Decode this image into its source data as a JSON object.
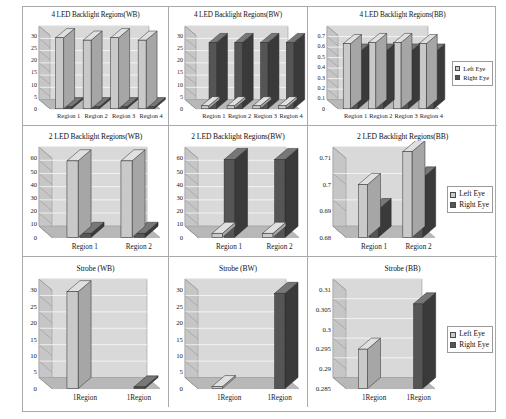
{
  "document": {
    "title": "Backlight Region Crosstalk Measurement Charts",
    "layout": "3x3 grid of 3D bar charts"
  },
  "legend": {
    "left_eye": "Left Eye",
    "right_eye": "Right Eye"
  },
  "colors": {
    "left_eye_fill": "#c9c9c9",
    "left_eye_side": "#a6a6a6",
    "left_eye_top": "#e0e0e0",
    "right_eye_fill": "#555555",
    "right_eye_side": "#3a3a3a",
    "right_eye_top": "#777777",
    "plot_back": "#d9d9d9",
    "plot_floor": "#b8b8b8",
    "plot_side": "#c6c6c6",
    "grid_line": "#ffffff",
    "border": "#a9a9a9"
  },
  "charts": [
    {
      "id": "chart-4led-wb",
      "chart_data": {
        "type": "bar",
        "title": "4 LED Backlight Regions(WB)",
        "xlabel": "",
        "ylabel": "",
        "categories": [
          "Region 1",
          "Region 2",
          "Region 3",
          "Region 4"
        ],
        "yticks": [
          0,
          5,
          10,
          15,
          20,
          25,
          30
        ],
        "ylim": [
          0,
          30
        ],
        "grid": true,
        "legend": false,
        "series": [
          {
            "name": "Left Eye",
            "values": [
              29.0,
              28.0,
              29.0,
              28.0
            ]
          },
          {
            "name": "Right Eye",
            "values": [
              0.8,
              0.8,
              0.8,
              0.8
            ]
          }
        ]
      }
    },
    {
      "id": "chart-4led-bw",
      "chart_data": {
        "type": "bar",
        "title": "4 LED Backlight Regions(BW)",
        "xlabel": "",
        "ylabel": "",
        "categories": [
          "Region 1",
          "Region 2",
          "Region 3",
          "Region 4"
        ],
        "yticks": [
          0,
          5,
          10,
          15,
          20,
          25,
          30
        ],
        "ylim": [
          0,
          30
        ],
        "grid": true,
        "legend": false,
        "series": [
          {
            "name": "Left Eye",
            "values": [
              1.2,
              1.2,
              1.2,
              1.2
            ]
          },
          {
            "name": "Right Eye",
            "values": [
              27.0,
              27.0,
              27.0,
              27.0
            ]
          }
        ]
      }
    },
    {
      "id": "chart-4led-bb",
      "chart_data": {
        "type": "bar",
        "title": "4 LED Backlight Regions(BB)",
        "xlabel": "",
        "ylabel": "",
        "categories": [
          "Region 1",
          "Region 2",
          "Region 3",
          "Region 4"
        ],
        "yticks": [
          0,
          0.1,
          0.2,
          0.3,
          0.4,
          0.5,
          0.6,
          0.7
        ],
        "yticklabels": [
          "0",
          "0.1",
          "0.2",
          "0.3",
          "0.4",
          "0.5",
          "0.6",
          "0.7"
        ],
        "ylim": [
          0,
          0.7
        ],
        "grid": true,
        "legend": true,
        "legend_position": "right",
        "series": [
          {
            "name": "Left Eye",
            "values": [
              0.62,
              0.63,
              0.63,
              0.62
            ]
          },
          {
            "name": "Right Eye",
            "values": [
              0.53,
              0.53,
              0.53,
              0.53
            ]
          }
        ]
      }
    },
    {
      "id": "chart-2led-wb",
      "chart_data": {
        "type": "bar",
        "title": "2 LED Backlight Regions(WB)",
        "xlabel": "",
        "ylabel": "",
        "categories": [
          "Region 1",
          "Region 2"
        ],
        "yticks": [
          0,
          10,
          20,
          30,
          40,
          50,
          60
        ],
        "ylim": [
          0,
          60
        ],
        "grid": true,
        "legend": false,
        "series": [
          {
            "name": "Left Eye",
            "values": [
              58.0,
              58.0
            ]
          },
          {
            "name": "Right Eye",
            "values": [
              3.0,
              3.0
            ]
          }
        ]
      }
    },
    {
      "id": "chart-2led-bw",
      "chart_data": {
        "type": "bar",
        "title": "2 LED Backlight Regions(BW)",
        "xlabel": "",
        "ylabel": "",
        "categories": [
          "Region 1",
          "Region 2"
        ],
        "yticks": [
          0,
          10,
          20,
          30,
          40,
          50,
          60
        ],
        "ylim": [
          0,
          60
        ],
        "grid": true,
        "legend": false,
        "series": [
          {
            "name": "Left Eye",
            "values": [
              3.0,
              3.0
            ]
          },
          {
            "name": "Right Eye",
            "values": [
              59.0,
              59.0
            ]
          }
        ]
      }
    },
    {
      "id": "chart-2led-bb",
      "chart_data": {
        "type": "bar",
        "title": "2 LED Backlight Regions(BB)",
        "xlabel": "",
        "ylabel": "",
        "categories": [
          "Region 1",
          "Region 2"
        ],
        "yticks": [
          0.68,
          0.69,
          0.7,
          0.71
        ],
        "yticklabels": [
          "0.68",
          "0.69",
          "0.7",
          "0.71"
        ],
        "ylim": [
          0.68,
          0.71
        ],
        "grid": true,
        "legend": true,
        "legend_position": "right",
        "series": [
          {
            "name": "Left Eye",
            "values": [
              0.7,
              0.7125
            ]
          },
          {
            "name": "Right Eye",
            "values": [
              0.6905,
              0.7025
            ]
          }
        ]
      }
    },
    {
      "id": "chart-strobe-wb",
      "chart_data": {
        "type": "bar",
        "title": "Strobe (WB)",
        "xlabel": "",
        "ylabel": "",
        "categories": [
          "1Region",
          "1Region"
        ],
        "yticks": [
          0,
          5,
          10,
          15,
          20,
          25,
          30
        ],
        "ylim": [
          0,
          30
        ],
        "grid": true,
        "legend": false,
        "series": [
          {
            "name": "Left Eye",
            "values": [
              29.5,
              0
            ]
          },
          {
            "name": "Right Eye",
            "values": [
              0,
              0.5
            ]
          }
        ]
      }
    },
    {
      "id": "chart-strobe-bw",
      "chart_data": {
        "type": "bar",
        "title": "Strobe (BW)",
        "xlabel": "",
        "ylabel": "",
        "categories": [
          "1Region",
          "1Region"
        ],
        "yticks": [
          0,
          5,
          10,
          15,
          20,
          25,
          30
        ],
        "ylim": [
          0,
          30
        ],
        "grid": true,
        "legend": false,
        "series": [
          {
            "name": "Left Eye",
            "values": [
              0.6,
              0
            ]
          },
          {
            "name": "Right Eye",
            "values": [
              0,
              29.0
            ]
          }
        ]
      }
    },
    {
      "id": "chart-strobe-bb",
      "chart_data": {
        "type": "bar",
        "title": "Strobe (BB)",
        "xlabel": "",
        "ylabel": "",
        "categories": [
          "1Region",
          "1Region"
        ],
        "yticks": [
          0.285,
          0.29,
          0.295,
          0.3,
          0.305,
          0.31
        ],
        "yticklabels": [
          "0.285",
          "0.29",
          "0.295",
          "0.3",
          "0.305",
          "0.31"
        ],
        "ylim": [
          0.285,
          0.31
        ],
        "grid": true,
        "legend": true,
        "legend_position": "right",
        "series": [
          {
            "name": "Left Eye",
            "values": [
              0.295,
              0
            ]
          },
          {
            "name": "Right Eye",
            "values": [
              0,
              0.3065
            ]
          }
        ]
      }
    }
  ]
}
